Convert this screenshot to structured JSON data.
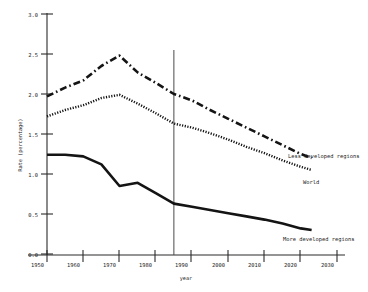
{
  "chart_data": {
    "type": "line",
    "title": "",
    "xlabel": "year",
    "ylabel": "Rate (percentage)",
    "xlim": [
      1950,
      2030
    ],
    "ylim": [
      0.0,
      3.0
    ],
    "grid": false,
    "legend_position": "inline-right-of-series",
    "x_ticks": [
      1950,
      1960,
      1970,
      1980,
      1990,
      2000,
      2010,
      2020,
      2030
    ],
    "x_tick_labels": [
      "1950",
      "1960",
      "1970",
      "1980",
      "1990",
      "2000",
      "2010",
      "2020",
      "2030"
    ],
    "y_ticks": [
      0.0,
      0.5,
      1.0,
      1.5,
      2.0,
      2.5,
      3.0
    ],
    "y_tick_labels": [
      "0.0",
      "0.5",
      "1.0",
      "1.5",
      "2.0",
      "2.5",
      "3.0"
    ],
    "annotations": [
      {
        "name": "estimate-projection-divider",
        "type": "vline",
        "x": 1985,
        "label": ""
      }
    ],
    "x": [
      1950,
      1955,
      1960,
      1965,
      1970,
      1975,
      1980,
      1985,
      1990,
      1995,
      2000,
      2005,
      2010,
      2015,
      2020,
      2023
    ],
    "series": [
      {
        "name": "Less developed regions",
        "style": "dash-dot",
        "label": "Less developed regions",
        "values": [
          1.97,
          2.08,
          2.17,
          2.35,
          2.48,
          2.27,
          2.14,
          2.0,
          1.92,
          1.8,
          1.69,
          1.58,
          1.47,
          1.36,
          1.25,
          1.2
        ]
      },
      {
        "name": "World",
        "style": "dotted",
        "label": "World",
        "values": [
          1.72,
          1.8,
          1.86,
          1.95,
          1.99,
          1.88,
          1.76,
          1.63,
          1.58,
          1.51,
          1.43,
          1.34,
          1.26,
          1.17,
          1.09,
          1.05
        ]
      },
      {
        "name": "More developed regions",
        "style": "solid",
        "label": "More developed regions",
        "values": [
          1.24,
          1.24,
          1.22,
          1.12,
          0.85,
          0.89,
          0.76,
          0.63,
          0.59,
          0.55,
          0.51,
          0.47,
          0.43,
          0.38,
          0.32,
          0.3
        ]
      }
    ]
  },
  "labels": {
    "less_developed": "Less developed regions",
    "world": "World",
    "more_developed": "More developed regions",
    "x_axis_title": "year",
    "y_axis_title": "Rate (percentage)"
  },
  "y_tick_text": {
    "t0": "0.0",
    "t1": "0.5",
    "t2": "1.0",
    "t3": "1.5",
    "t4": "2.0",
    "t5": "2.5",
    "t6": "3.0"
  },
  "x_tick_text": {
    "t1950": "1950",
    "t1960": "1960",
    "t1970": "1970",
    "t1980": "1980",
    "t1990": "1990",
    "t2000": "2000",
    "t2010": "2010",
    "t2020": "2020",
    "t2030": "2030"
  },
  "colors": {
    "ink": "#141414",
    "axis": "#2b2b2b",
    "divider": "#4a4a4a",
    "background": "#ffffff"
  }
}
